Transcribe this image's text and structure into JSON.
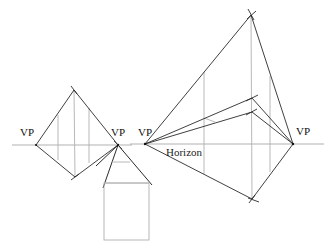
{
  "diagram": {
    "colors": {
      "background": "#ffffff",
      "construction_line": "#222222",
      "guide_line": "#b0b0b0",
      "text": "#111111"
    },
    "labels": {
      "vp_left_diamond": "VP",
      "vp_shared": "VP",
      "vp_right_figure_left": "VP",
      "vp_right_figure_right": "VP",
      "horizon": "Horizon"
    },
    "figures": [
      {
        "name": "left-diamond",
        "vanishing_points": [
          [
            36,
            145
          ],
          [
            118,
            145
          ]
        ],
        "top": [
          74,
          90
        ],
        "bottom": [
          75,
          177
        ],
        "verticals_x": [
          58,
          74,
          89
        ]
      },
      {
        "name": "house",
        "apex": [
          118,
          145
        ],
        "ridge_y": 162,
        "eave_y": 183,
        "box": {
          "x": 104,
          "y": 183,
          "w": 45,
          "h": 57
        }
      },
      {
        "name": "right-figure",
        "vanishing_points": [
          [
            145,
            144
          ],
          [
            293,
            144
          ]
        ],
        "top": [
          251,
          15
        ],
        "bottom": [
          252,
          199
        ],
        "inner_points": [
          [
            251,
            98
          ],
          [
            252,
            112
          ]
        ],
        "verticals_x": [
          204,
          251,
          270
        ]
      }
    ]
  }
}
